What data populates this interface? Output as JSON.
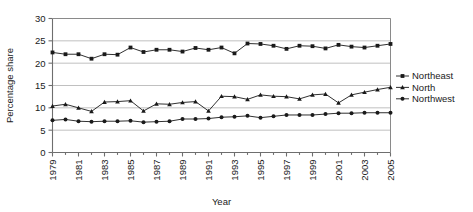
{
  "chart_data": {
    "type": "line",
    "title": "",
    "xlabel": "Year",
    "ylabel": "Percentage share",
    "xlim": [
      1979,
      2005
    ],
    "ylim": [
      0,
      30
    ],
    "yticks": [
      0,
      5,
      10,
      15,
      20,
      25,
      30
    ],
    "xticks": [
      1979,
      1981,
      1983,
      1985,
      1987,
      1989,
      1991,
      1993,
      1995,
      1997,
      1999,
      2001,
      2003,
      2005
    ],
    "xtick_labels": [
      "1979",
      "1981",
      "1983",
      "1985",
      "1987",
      "1989",
      "1991",
      "1993",
      "1995",
      "1997",
      "1999",
      "2001",
      "2003",
      "2005"
    ],
    "ytick_labels": [
      "0",
      "5",
      "10",
      "15",
      "20",
      "25",
      "30"
    ],
    "grid": "horizontal",
    "legend_position": "right",
    "x": [
      1979,
      1980,
      1981,
      1982,
      1983,
      1984,
      1985,
      1986,
      1987,
      1988,
      1989,
      1990,
      1991,
      1992,
      1993,
      1994,
      1995,
      1996,
      1997,
      1998,
      1999,
      2000,
      2001,
      2002,
      2003,
      2004,
      2005
    ],
    "series": [
      {
        "name": "Northeast",
        "marker": "square",
        "color": "#1a1a1a",
        "values": [
          22.4,
          22.0,
          22.0,
          21.0,
          22.0,
          21.9,
          23.5,
          22.5,
          23.0,
          23.0,
          22.6,
          23.4,
          23.0,
          23.5,
          22.2,
          24.4,
          24.3,
          23.9,
          23.2,
          23.9,
          23.8,
          23.3,
          24.1,
          23.7,
          23.5,
          23.9,
          24.3
        ]
      },
      {
        "name": "North",
        "marker": "triangle",
        "color": "#1a1a1a",
        "values": [
          10.4,
          10.8,
          10.0,
          9.2,
          11.3,
          11.4,
          11.6,
          9.3,
          10.9,
          10.8,
          11.2,
          11.4,
          9.3,
          12.6,
          12.5,
          11.9,
          12.9,
          12.6,
          12.5,
          12.0,
          12.9,
          13.1,
          11.1,
          12.9,
          13.5,
          14.1,
          14.6
        ]
      },
      {
        "name": "Northwest",
        "marker": "circle",
        "color": "#1a1a1a",
        "values": [
          7.2,
          7.4,
          7.0,
          6.9,
          7.0,
          7.0,
          7.1,
          6.8,
          6.9,
          7.0,
          7.5,
          7.5,
          7.6,
          7.9,
          8.0,
          8.2,
          7.8,
          8.1,
          8.4,
          8.4,
          8.4,
          8.6,
          8.8,
          8.8,
          8.9,
          8.9,
          8.9
        ]
      }
    ]
  }
}
